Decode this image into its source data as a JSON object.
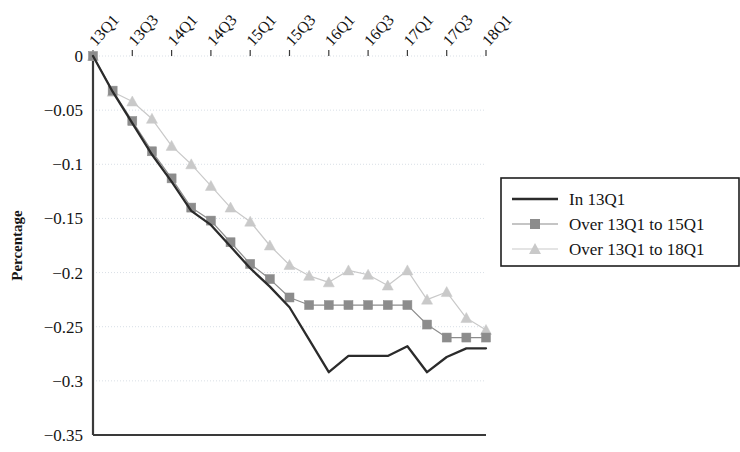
{
  "chart_data": {
    "type": "line",
    "title": "",
    "xlabel": "",
    "ylabel": "Percentage",
    "ylim": [
      -0.35,
      0
    ],
    "yticks": [
      0,
      -0.05,
      -0.1,
      -0.15,
      -0.2,
      -0.25,
      -0.3,
      -0.35
    ],
    "ytick_labels": [
      "0",
      "−0.05",
      "−0.1",
      "−0.15",
      "−0.2",
      "−0.25",
      "−0.3",
      "−0.35"
    ],
    "grid": true,
    "legend_position": "right",
    "x": [
      "13Q1",
      "13Q2",
      "13Q3",
      "13Q4",
      "14Q1",
      "14Q2",
      "14Q3",
      "14Q4",
      "15Q1",
      "15Q2",
      "15Q3",
      "15Q4",
      "16Q1",
      "16Q2",
      "16Q3",
      "16Q4",
      "17Q1",
      "17Q2",
      "17Q3",
      "17Q4",
      "18Q1"
    ],
    "xtick_labels": [
      "13Q1",
      "13Q3",
      "14Q1",
      "14Q3",
      "15Q1",
      "15Q3",
      "16Q1",
      "16Q3",
      "17Q1",
      "17Q3",
      "18Q1"
    ],
    "xtick_indices": [
      0,
      2,
      4,
      6,
      8,
      10,
      12,
      14,
      16,
      18,
      20
    ],
    "series": [
      {
        "name": "In 13Q1",
        "marker": "none",
        "color": "#2b2b2b",
        "values": [
          0,
          -0.033,
          -0.062,
          -0.091,
          -0.116,
          -0.143,
          -0.156,
          -0.176,
          -0.196,
          -0.213,
          -0.232,
          -0.262,
          -0.292,
          -0.277,
          -0.277,
          -0.277,
          -0.268,
          -0.292,
          -0.278,
          -0.27,
          -0.27
        ]
      },
      {
        "name": "Over 13Q1 to 15Q1",
        "marker": "square",
        "color": "#8c8c8c",
        "values": [
          0,
          -0.032,
          -0.06,
          -0.088,
          -0.113,
          -0.14,
          -0.152,
          -0.172,
          -0.192,
          -0.206,
          -0.223,
          -0.23,
          -0.23,
          -0.23,
          -0.23,
          -0.23,
          -0.23,
          -0.248,
          -0.26,
          -0.26,
          -0.26
        ]
      },
      {
        "name": "Over 13Q1 to 18Q1",
        "marker": "triangle",
        "color": "#c9c9c9",
        "values": [
          0,
          -0.033,
          -0.042,
          -0.058,
          -0.083,
          -0.1,
          -0.12,
          -0.14,
          -0.153,
          -0.175,
          -0.193,
          -0.203,
          -0.209,
          -0.198,
          -0.202,
          -0.212,
          -0.198,
          -0.225,
          -0.218,
          -0.242,
          -0.253
        ]
      }
    ]
  },
  "legend": {
    "entries": [
      {
        "label": "In 13Q1"
      },
      {
        "label": "Over 13Q1 to 15Q1"
      },
      {
        "label": "Over 13Q1 to 18Q1"
      }
    ]
  },
  "colors": {
    "axis": "#3a3a3a",
    "grid": "#d9dfe6",
    "series_1": "#2b2b2b",
    "series_2": "#8c8c8c",
    "series_3": "#c9c9c9",
    "legend_border": "#1f1f1f"
  }
}
